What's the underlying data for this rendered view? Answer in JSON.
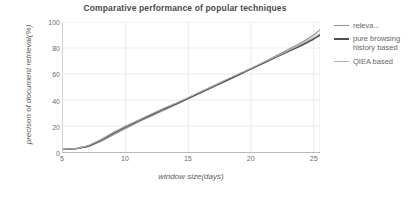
{
  "chart_data": {
    "type": "line",
    "title": "Comparative performance of popular techniques",
    "xlabel": "window size(days)",
    "ylabel": "precison of document retrieval(%)",
    "xlim": [
      5,
      25.5
    ],
    "ylim": [
      0,
      100
    ],
    "xticks": [
      5,
      10,
      15,
      20,
      25
    ],
    "yticks": [
      0,
      20,
      40,
      60,
      80,
      100
    ],
    "grid": true,
    "legend_position": "right",
    "x": [
      5,
      6,
      7,
      8,
      9,
      10,
      11,
      12,
      13,
      14,
      15,
      16,
      17,
      18,
      19,
      20,
      21,
      22,
      23,
      24,
      25,
      25.5
    ],
    "series": [
      {
        "name": "relevance feedback based",
        "legend_label": "releva...",
        "color": "#8e8e8e",
        "width": 1.1,
        "values": [
          2,
          2.5,
          4,
          8,
          13,
          18,
          23,
          27.5,
          32,
          36.5,
          41,
          45.5,
          50,
          54.5,
          59,
          64,
          69,
          74,
          79,
          84,
          90,
          94
        ]
      },
      {
        "name": "pure browsing history based",
        "legend_label": "pure browsing history based",
        "color": "#4d4d4d",
        "width": 1.7,
        "values": [
          2,
          2.5,
          4.5,
          9,
          14.5,
          19.5,
          24,
          28.5,
          33,
          37,
          41.5,
          46,
          50.5,
          55,
          59.5,
          64,
          68.5,
          73,
          77.5,
          82,
          87,
          90
        ]
      },
      {
        "name": "QIEA based",
        "legend_label": "QIEA based",
        "color": "#adadad",
        "width": 1.1,
        "values": [
          2,
          2.6,
          4.8,
          9.5,
          15,
          20,
          24.5,
          29,
          33.5,
          37.5,
          42,
          46.5,
          51,
          55.5,
          60,
          64.5,
          69,
          73.5,
          78,
          83,
          88,
          91
        ]
      }
    ]
  }
}
